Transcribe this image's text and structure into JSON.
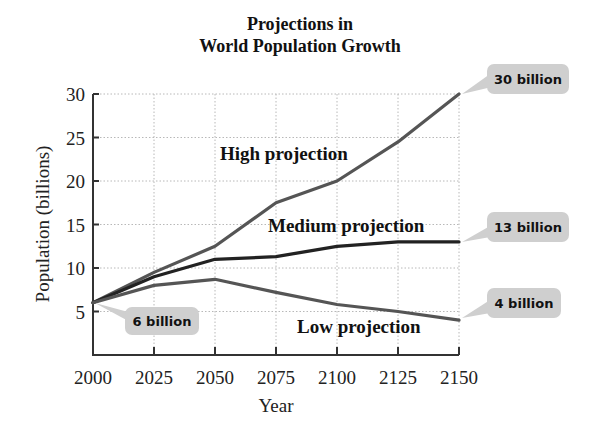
{
  "chart_data": {
    "type": "line",
    "title": "Projections in World Population Growth",
    "title_lines": [
      "Projections in",
      "World Population Growth"
    ],
    "xlabel": "Year",
    "ylabel": "Population (billions)",
    "x": [
      2000,
      2025,
      2050,
      2075,
      2100,
      2125,
      2150
    ],
    "xticks": [
      "2000",
      "2025",
      "2050",
      "2075",
      "2100",
      "2125",
      "2150"
    ],
    "yticks": [
      "5",
      "10",
      "15",
      "20",
      "25",
      "30"
    ],
    "ylim": [
      0,
      30
    ],
    "xlim": [
      2000,
      2150
    ],
    "grid": true,
    "series": [
      {
        "name": "High projection",
        "values": [
          6,
          9.5,
          12.5,
          17.5,
          20,
          24.5,
          30
        ],
        "color": "#555555"
      },
      {
        "name": "Medium projection",
        "values": [
          6,
          9,
          11,
          11.3,
          12.5,
          13,
          13
        ],
        "color": "#222222"
      },
      {
        "name": "Low projection",
        "values": [
          6,
          8,
          8.7,
          7.2,
          5.8,
          5,
          4
        ],
        "color": "#555555"
      }
    ],
    "annotations": [
      {
        "text": "6 billion",
        "x": 2000,
        "y": 6
      },
      {
        "text": "30 billion",
        "x": 2150,
        "y": 30
      },
      {
        "text": "13 billion",
        "x": 2150,
        "y": 13
      },
      {
        "text": "4 billion",
        "x": 2150,
        "y": 4
      }
    ]
  }
}
